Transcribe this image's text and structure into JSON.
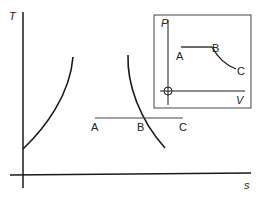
{
  "main_chart": {
    "y_axis_label": "T",
    "x_axis_label": "s",
    "process_line": {
      "points": [
        {
          "label": "A"
        },
        {
          "label": "B"
        },
        {
          "label": "C"
        }
      ]
    }
  },
  "inset_chart": {
    "y_axis_label": "P",
    "x_axis_label": "V",
    "points": [
      {
        "label": "A"
      },
      {
        "label": "B"
      },
      {
        "label": "C"
      }
    ]
  },
  "colors": {
    "line": "#1a1a1a",
    "thin_line": "#444444",
    "text": "#222222"
  }
}
